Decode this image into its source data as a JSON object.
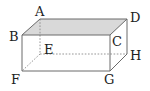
{
  "diagram": {
    "type": "rectangular-prism",
    "colors": {
      "edge": "#6a6a6a",
      "hidden_edge": "#8a8a8a",
      "top_face_fill": "#d9d9d9",
      "label": "#222222",
      "background": "#ffffff"
    },
    "vertices": {
      "A": {
        "label": "A",
        "x": 40,
        "y": 19
      },
      "B": {
        "label": "B",
        "x": 22,
        "y": 35
      },
      "C": {
        "label": "C",
        "x": 110,
        "y": 35
      },
      "D": {
        "label": "D",
        "x": 127,
        "y": 19
      },
      "E": {
        "label": "E",
        "x": 40,
        "y": 54
      },
      "F": {
        "label": "F",
        "x": 22,
        "y": 71
      },
      "G": {
        "label": "G",
        "x": 110,
        "y": 71
      },
      "H": {
        "label": "H",
        "x": 127,
        "y": 54
      }
    },
    "shaded_face": [
      "A",
      "B",
      "C",
      "D"
    ],
    "hidden_edges": [
      [
        "A",
        "E"
      ],
      [
        "E",
        "H"
      ],
      [
        "E",
        "F"
      ]
    ],
    "visible_edges": [
      [
        "A",
        "B"
      ],
      [
        "B",
        "C"
      ],
      [
        "C",
        "D"
      ],
      [
        "D",
        "A"
      ],
      [
        "B",
        "F"
      ],
      [
        "F",
        "G"
      ],
      [
        "G",
        "C"
      ],
      [
        "G",
        "H"
      ],
      [
        "H",
        "D"
      ]
    ]
  }
}
